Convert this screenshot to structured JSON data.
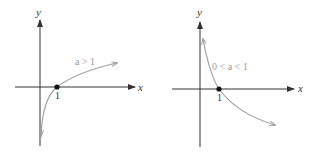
{
  "figure": {
    "panels": [
      {
        "id": "left",
        "x_axis_label": "x",
        "y_axis_label": "y",
        "tick_label": "1",
        "curve_label": "a > 1",
        "description": "increasing logarithmic curve through (1,0)"
      },
      {
        "id": "right",
        "x_axis_label": "x",
        "y_axis_label": "y",
        "tick_label": "1",
        "curve_label": "0 < a < 1",
        "description": "decreasing logarithmic curve through (1,0)"
      }
    ],
    "colors": {
      "axis": "#333333",
      "curve": "#a0a0a0",
      "point": "#111111"
    }
  }
}
